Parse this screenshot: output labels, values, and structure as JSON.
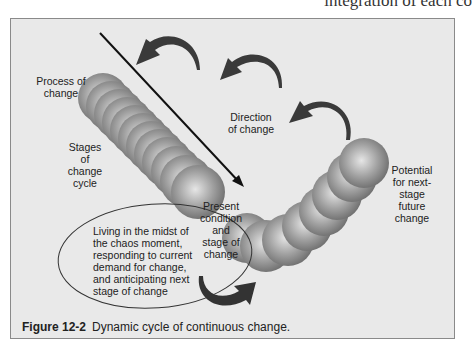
{
  "page": {
    "running_text": "integration of each co"
  },
  "figure": {
    "number": "Figure 12-2",
    "caption": "Dynamic cycle of continuous change.",
    "labels": {
      "process": "Process of change",
      "stages": "Stages of change cycle",
      "direction": "Direction of change",
      "present": "Present condition and stage of change",
      "potential": "Potential for next-stage future change",
      "living": "Living in the midst of the chaos moment, responding to current demand for change, and anticipating next stage of change"
    },
    "colors": {
      "background": "#e9e9e9",
      "border": "#8a8a8a",
      "arrow": "#3a3a3a",
      "sphere_light": "#d8d8d8",
      "sphere_dark": "#6a6a6a"
    }
  }
}
